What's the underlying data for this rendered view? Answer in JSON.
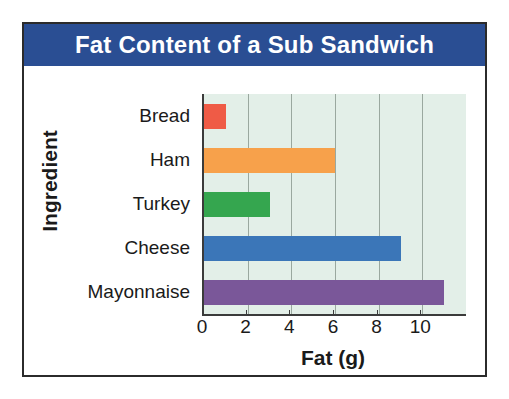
{
  "chart_data": {
    "type": "bar",
    "orientation": "horizontal",
    "title": "Fat Content of a Sub Sandwich",
    "xlabel": "Fat (g)",
    "ylabel": "Ingredient",
    "categories": [
      "Bread",
      "Ham",
      "Turkey",
      "Cheese",
      "Mayonnaise"
    ],
    "values": [
      1,
      6,
      3,
      9,
      11
    ],
    "bar_colors": [
      "#ef5b46",
      "#f7a14b",
      "#34a košice"
    ],
    "xlim": [
      0,
      12
    ],
    "xticks": [
      0,
      2,
      4,
      6,
      8,
      10
    ],
    "xtick_labels": [
      "0",
      "2",
      "4",
      "6",
      "8",
      "10"
    ],
    "grid": true,
    "legend": false,
    "bars": [
      {
        "category": "Bread",
        "value": 1,
        "color": "#ef5b46"
      },
      {
        "category": "Ham",
        "value": 6,
        "color": "#f7a14b"
      },
      {
        "category": "Turkey",
        "value": 3,
        "color": "#35a64f"
      },
      {
        "category": "Cheese",
        "value": 9,
        "color": "#3b76b8"
      },
      {
        "category": "Mayonnaise",
        "value": 11,
        "color": "#7a5799"
      }
    ]
  },
  "style": {
    "banner_color": "#2a4e93",
    "banner_text_color": "#ffffff",
    "plot_background": "#e3efe8",
    "gridline_color": "#9aa89f",
    "axis_color": "#3b3b3b",
    "frame_color": "#2b2b2b"
  }
}
